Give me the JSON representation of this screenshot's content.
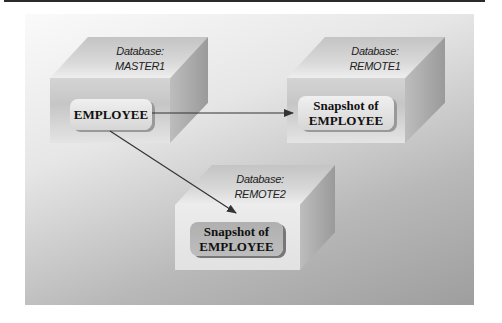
{
  "diagram": {
    "databases": [
      {
        "id": "master1",
        "caption_line1": "Database:",
        "caption_line2": "MASTER1",
        "table_label_line1": "EMPLOYEE",
        "table_label_line2": ""
      },
      {
        "id": "remote1",
        "caption_line1": "Database:",
        "caption_line2": "REMOTE1",
        "table_label_line1": "Snapshot of",
        "table_label_line2": "EMPLOYEE"
      },
      {
        "id": "remote2",
        "caption_line1": "Database:",
        "caption_line2": "REMOTE2",
        "table_label_line1": "Snapshot of",
        "table_label_line2": "EMPLOYEE"
      }
    ],
    "arrows": [
      {
        "from": "master1",
        "to": "remote1"
      },
      {
        "from": "master1",
        "to": "remote2"
      }
    ],
    "colors": {
      "rule": "#2a2a2a",
      "arrow": "#333333"
    }
  }
}
